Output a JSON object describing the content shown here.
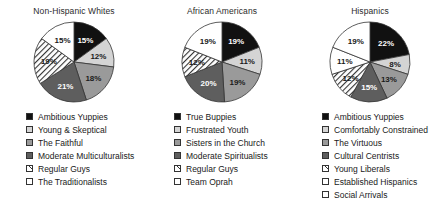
{
  "chart_data": [
    {
      "type": "pie",
      "title": "Non-Hispanic Whites",
      "legend_position": "bottom",
      "categories": [
        "Ambitious Yuppies",
        "Young & Skeptical",
        "The Faithful",
        "Moderate Multiculturalists",
        "Regular Guys",
        "The Traditionalists"
      ],
      "values": [
        15,
        12,
        18,
        21,
        19,
        15
      ],
      "labels": [
        "15%",
        "12%",
        "18%",
        "21%",
        "19%",
        "15%"
      ],
      "fills": [
        "black",
        "lightgray",
        "mediumgray",
        "darkgray",
        "hatch",
        "white"
      ],
      "xlabel": "",
      "ylabel": ""
    },
    {
      "type": "pie",
      "title": "African Americans",
      "legend_position": "bottom",
      "categories": [
        "True Buppies",
        "Frustrated Youth",
        "Sisters in the Church",
        "Moderate Spiritualists",
        "Regular Guys",
        "Team Oprah"
      ],
      "values": [
        19,
        11,
        19,
        20,
        12,
        19
      ],
      "labels": [
        "19%",
        "11%",
        "19%",
        "20%",
        "12%",
        "19%"
      ],
      "fills": [
        "black",
        "lightgray",
        "mediumgray",
        "darkgray",
        "hatch",
        "white"
      ],
      "xlabel": "",
      "ylabel": ""
    },
    {
      "type": "pie",
      "title": "Hispanics",
      "legend_position": "bottom",
      "categories": [
        "Ambitious Yuppies",
        "Comfortably Constrained",
        "The Virtuous",
        "Cultural Centrists",
        "Young Liberals",
        "Established Hispanics",
        "Social Arrivals"
      ],
      "values": [
        22,
        8,
        13,
        15,
        12,
        11,
        19
      ],
      "labels": [
        "22%",
        "8%",
        "13%",
        "15%",
        "12%",
        "11%",
        "19%"
      ],
      "fills": [
        "black",
        "lightgray",
        "mediumgray",
        "darkgray",
        "hatch",
        "white",
        "white"
      ],
      "xlabel": "",
      "ylabel": ""
    }
  ],
  "palette": {
    "black": "#111111",
    "lightgray": "#d4d4d4",
    "mediumgray": "#9a9a9a",
    "darkgray": "#5e5e5e",
    "white": "#ffffff",
    "hatch": "#ffffff",
    "stroke": "#333333",
    "text": "#1a1a1a"
  }
}
